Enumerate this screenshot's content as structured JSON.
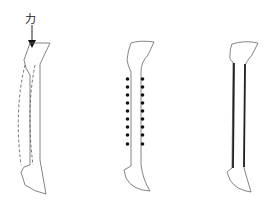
{
  "figure": {
    "force_label": "力",
    "panels": [
      {
        "id": "a",
        "description": "Bone with applied force arrow and dashed bending outline"
      },
      {
        "id": "b",
        "description": "Bone with two rows of dots along shaft",
        "dot_rows": 2,
        "dots_per_row": 9
      },
      {
        "id": "c",
        "description": "Bone with thickened shaft walls"
      }
    ],
    "colors": {
      "stroke": "#555555",
      "dots": "#111111",
      "arrow": "#111111"
    }
  }
}
